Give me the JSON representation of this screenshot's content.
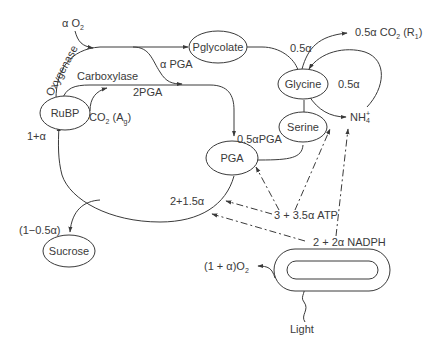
{
  "diagram": {
    "nodes": {
      "rubp": "RuBP",
      "pglycolate": "Pglycolate",
      "glycine": "Glycine",
      "serine": "Serine",
      "pga": "PGA",
      "sucrose": "Sucrose",
      "light": "Light"
    },
    "labels": {
      "alpha_o2": "α O",
      "alpha_o2_sub": "2",
      "oxygenase": "Oxygenase",
      "carboxylase": "Carboxylase",
      "alpha_pga": "α PGA",
      "two_pga": "2PGA",
      "co2_ag": "CO",
      "co2_ag_sub": "2",
      "co2_ag_tail": " (A",
      "co2_ag_tail_sub": "g",
      "co2_ag_close": ")",
      "one_plus_alpha": "1+α",
      "half_alpha_top": "0.5α",
      "half_alpha_co2": "0.5α CO",
      "half_alpha_co2_sub": "2",
      "half_alpha_co2_tail": " (R",
      "half_alpha_co2_tail_sub": "1",
      "half_alpha_co2_close": ")",
      "half_alpha_right": "0.5α",
      "nh4": "NH",
      "nh4_sup": "+",
      "nh4_sub": "4",
      "half_alpha_pga": "0.5αPGA",
      "two_plus_1_5_alpha": "2+1.5α",
      "atp": "3 + 3.5α ATP",
      "nadph": "2 + 2α NADPH",
      "one_minus_half_alpha": "(1−0.5α)",
      "o2_out": "(1 + α)O",
      "o2_out_sub": "2"
    }
  }
}
